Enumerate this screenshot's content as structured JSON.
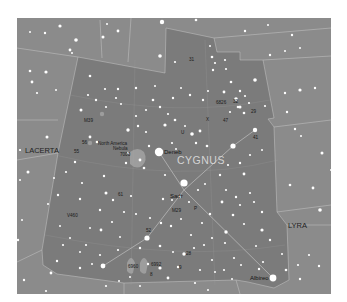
{
  "map": {
    "title": "Cygnus star chart",
    "colors": {
      "page_background": "#ffffff",
      "sky_outside": "#8b8b8b",
      "sky_cygnus": "#7b7b7b",
      "boundary": "#c8c8c8",
      "asterism": "#b8b8b8",
      "star": "#ffffff",
      "nebula": "#a9a9a9"
    },
    "constellations": {
      "main": "CYGNUS",
      "neighbors": [
        "LACERTA",
        "LYRA"
      ]
    },
    "bright_stars": [
      "Deneb",
      "Sadr",
      "Albireo"
    ],
    "objects": [
      {
        "label": "M39"
      },
      {
        "label": "North America Nebula"
      },
      {
        "label": "7000"
      },
      {
        "label": "M29"
      },
      {
        "label": "6826"
      },
      {
        "label": "6992"
      },
      {
        "label": "6960"
      },
      {
        "label": "P"
      },
      {
        "label": "U"
      },
      {
        "label": "X"
      },
      {
        "label": "V1",
        "note": "map label"
      }
    ],
    "star_labels": [
      "31",
      "32",
      "56",
      "55",
      "61",
      "V460",
      "47",
      "29",
      "28",
      "41",
      "52",
      "9",
      "8",
      "R",
      "CH",
      "chi"
    ],
    "asterism_lines": [
      [
        "Deneb",
        "Sadr"
      ],
      [
        "Sadr",
        "Albireo"
      ],
      [
        "Sadr",
        "wing-west"
      ],
      [
        "Sadr",
        "wing-east"
      ],
      [
        "wing-east",
        "wing-east-tip"
      ],
      [
        "wing-west",
        "wing-west-tip"
      ]
    ]
  }
}
